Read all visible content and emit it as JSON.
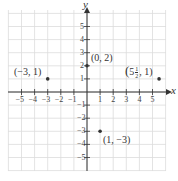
{
  "chart_data": {
    "type": "scatter",
    "title": "",
    "xlabel": "x",
    "ylabel": "y",
    "xlim": [
      -6,
      6
    ],
    "ylim": [
      -6,
      6
    ],
    "grid": true,
    "x_ticks": [
      "-5",
      "-4",
      "-3",
      "-2",
      "-1",
      "1",
      "2",
      "3",
      "4",
      "5"
    ],
    "y_ticks": [
      "5",
      "4",
      "3",
      "2",
      "1",
      "-1",
      "-2",
      "-3",
      "-4",
      "-5"
    ],
    "points": [
      {
        "x": 0,
        "y": 2,
        "label": "(0, 2)"
      },
      {
        "x": -3,
        "y": 1,
        "label": "(−3, 1)"
      },
      {
        "x": 5.5,
        "y": 1,
        "label": "(5½, 1)"
      },
      {
        "x": 1,
        "y": -3,
        "label": "(1, −3)"
      }
    ]
  },
  "labels": {
    "x_axis": "x",
    "y_axis": "y",
    "p1": "(0, 2)",
    "p2": "(−3, 1)",
    "p3_whole": "5",
    "p3_num": "1",
    "p3_den": "2",
    "p3_rest": ", 1)",
    "p3_open": "(",
    "p4": "(1, −3)"
  },
  "colors": {
    "grid": "#d9d9d9",
    "axis": "#333333",
    "point": "#333333"
  }
}
